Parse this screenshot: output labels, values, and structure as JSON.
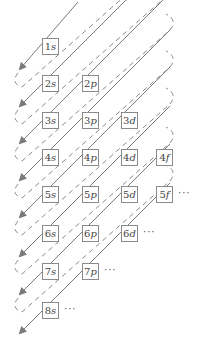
{
  "colors": {
    "arrow": "#7a7a7a",
    "dashed": "#8a8a8a",
    "box_border": "#8a8a8a",
    "text": "#444444"
  },
  "orbitals": [
    {
      "n": "1",
      "l": "s",
      "col": 0,
      "row": 0
    },
    {
      "n": "2",
      "l": "s",
      "col": 0,
      "row": 1
    },
    {
      "n": "2",
      "l": "p",
      "col": 1,
      "row": 1
    },
    {
      "n": "3",
      "l": "s",
      "col": 0,
      "row": 2
    },
    {
      "n": "3",
      "l": "p",
      "col": 1,
      "row": 2
    },
    {
      "n": "3",
      "l": "d",
      "col": 2,
      "row": 2
    },
    {
      "n": "4",
      "l": "s",
      "col": 0,
      "row": 3
    },
    {
      "n": "4",
      "l": "p",
      "col": 1,
      "row": 3
    },
    {
      "n": "4",
      "l": "d",
      "col": 2,
      "row": 3
    },
    {
      "n": "4",
      "l": "f",
      "col": 3,
      "row": 3
    },
    {
      "n": "5",
      "l": "s",
      "col": 0,
      "row": 4
    },
    {
      "n": "5",
      "l": "p",
      "col": 1,
      "row": 4
    },
    {
      "n": "5",
      "l": "d",
      "col": 2,
      "row": 4
    },
    {
      "n": "5",
      "l": "f",
      "col": 3,
      "row": 4
    },
    {
      "n": "6",
      "l": "s",
      "col": 0,
      "row": 5
    },
    {
      "n": "6",
      "l": "p",
      "col": 1,
      "row": 5
    },
    {
      "n": "6",
      "l": "d",
      "col": 2,
      "row": 5
    },
    {
      "n": "7",
      "l": "s",
      "col": 0,
      "row": 6
    },
    {
      "n": "7",
      "l": "p",
      "col": 1,
      "row": 6
    },
    {
      "n": "8",
      "l": "s",
      "col": 0,
      "row": 7
    }
  ],
  "ellipses": [
    {
      "row": 4,
      "after_col": 3,
      "text": "···"
    },
    {
      "row": 5,
      "after_col": 2,
      "text": "···"
    },
    {
      "row": 6,
      "after_col": 1,
      "text": "···"
    },
    {
      "row": 7,
      "after_col": 0,
      "text": "···"
    }
  ]
}
